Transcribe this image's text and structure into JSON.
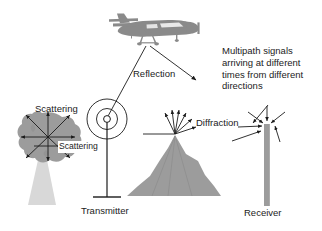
{
  "figure": {
    "background_color": "#ffffff",
    "ink_color": "#1b1b1b",
    "fill_gray_dark": "#8a8a8a",
    "fill_gray_mid": "#9c9c9c",
    "fill_gray_light": "#d6d6d6"
  },
  "labels": {
    "reflection": "Reflection",
    "scattering_top": "Scattering",
    "scattering_inner": "Scattering",
    "diffraction": "Diffraction",
    "multipath": "Multipath signals arriving at different times from different directions",
    "transmitter": "Transmitter",
    "receiver": "Receiver"
  },
  "objects": {
    "airplane": "airplane-icon",
    "tree": "tree-icon",
    "mountain": "mountain-icon",
    "transmitter_antenna": "antenna-icon",
    "receiver_antenna": "receiver-antenna-icon",
    "wave_rings": "concentric-wave-rings-icon"
  },
  "counts": {
    "scattering_arrows": 8,
    "diffraction_arrows": 7,
    "multipath_arrows_at_receiver": 6,
    "wave_rings": 2
  }
}
